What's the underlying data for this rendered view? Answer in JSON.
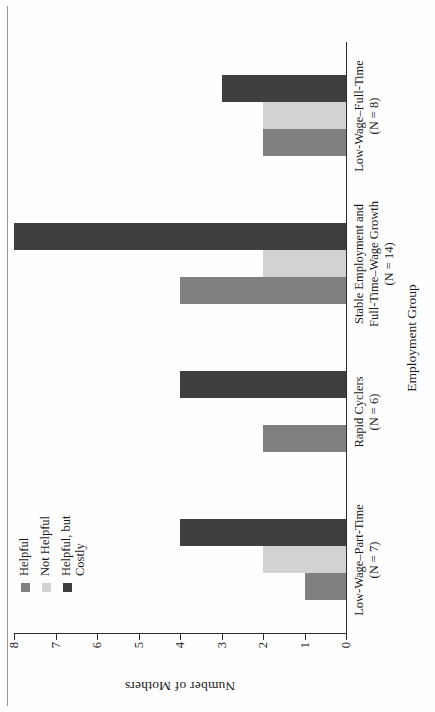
{
  "chart_data": {
    "type": "bar",
    "orientation": "horizontal-grouped",
    "title": "",
    "xlabel": "Employment Group",
    "ylabel": "Number of Mothers",
    "ylim": [
      0,
      8
    ],
    "yticks": [
      0,
      1,
      2,
      3,
      4,
      5,
      6,
      7,
      8
    ],
    "grid": false,
    "legend_position": "top-left",
    "categories": [
      "Low-Wage–Part-Time\n(N = 7)",
      "Rapid Cyclers\n(N = 6)",
      "Stable Employment and\nFull-Time–Wage Growth\n(N = 14)",
      "Low-Wage–Full-Time\n(N = 8)"
    ],
    "category_lines": [
      [
        "Low-Wage–Part-Time",
        "(N = 7)"
      ],
      [
        "Rapid Cyclers",
        "(N = 6)"
      ],
      [
        "Stable Employment and",
        "Full-Time–Wage Growth",
        "(N = 14)"
      ],
      [
        "Low-Wage–Full-Time",
        "(N = 8)"
      ]
    ],
    "series": [
      {
        "name": "Helpful",
        "color": "#808080",
        "values": [
          1,
          2,
          4,
          2
        ]
      },
      {
        "name": "Not Helpful",
        "color": "#d2d2d2",
        "values": [
          2,
          0,
          2,
          2
        ]
      },
      {
        "name": "Helpful, but Costly",
        "color": "#3f3f3f",
        "values": [
          4,
          4,
          8,
          3
        ]
      }
    ]
  },
  "legend": {
    "entries": [
      {
        "label": "Helpful",
        "color": "#808080"
      },
      {
        "label": "Not Helpful",
        "color": "#d2d2d2"
      },
      {
        "label": "Helpful, but\nCostly",
        "color": "#3f3f3f"
      }
    ]
  },
  "axis": {
    "value_title": "Number of Mothers",
    "category_title": "Employment Group",
    "tick_labels": [
      "0",
      "1",
      "2",
      "3",
      "4",
      "5",
      "6",
      "7",
      "8"
    ]
  }
}
